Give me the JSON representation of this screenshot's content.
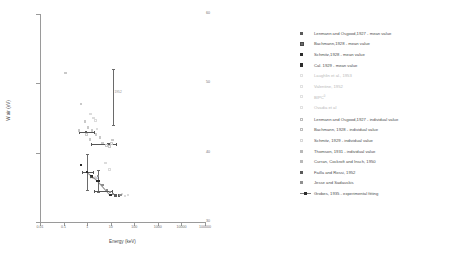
{
  "chart_data": {
    "type": "scatter",
    "title": "",
    "xlabel": "Energy (keV)",
    "ylabel": "W air (eV)",
    "xscale": "log",
    "yscale": "linear",
    "xlim": [
      0.01,
      100000
    ],
    "ylim": [
      30,
      60
    ],
    "xticks": [
      "0.01",
      "0.1",
      "1",
      "10",
      "100",
      "1000",
      "10000",
      "100000"
    ],
    "yticks": [
      "60",
      "50",
      "40",
      "30"
    ],
    "grid": false,
    "legend_position": "right",
    "series": [
      {
        "name": "Lenmann and Osgood,1927 - mean value",
        "marker": "filled-square",
        "points": [
          [
            0.9,
            43.0
          ]
        ]
      },
      {
        "name": "Bachmann,1928 - mean value",
        "marker": "large-filled-square",
        "points": [
          [
            8.0,
            41.2
          ]
        ]
      },
      {
        "name": "Schmitz,1928 - mean value",
        "marker": "filled-square-dark",
        "points": [
          [
            2.8,
            35.9
          ],
          [
            10.0,
            33.9
          ]
        ]
      },
      {
        "name": "Cal. 1929 - mean value",
        "marker": "filled-square-dark",
        "points": [
          [
            0.55,
            38.2
          ],
          [
            1.0,
            37.2
          ],
          [
            1.5,
            36.6
          ]
        ]
      },
      {
        "name": "Laughlin et al., 1953",
        "marker": "open-square-faint",
        "points": [
          [
            6.0,
            38.5
          ],
          [
            9.0,
            37.6
          ]
        ]
      },
      {
        "name": "Valentine, 1952",
        "marker": "dot-faint",
        "points": [
          [
            30.0,
            34.0
          ]
        ]
      },
      {
        "name": "BIPC",
        "marker": "tick-faint",
        "points": [
          [
            40.0,
            33.8
          ]
        ]
      },
      {
        "name": "Ovadia et al",
        "marker": "cross-faint",
        "points": [
          [
            55.0,
            33.9
          ]
        ]
      },
      {
        "name": "Lenmann and Osgood,1927 - individual value",
        "marker": "open-square",
        "points": [
          [
            0.12,
            51.5
          ],
          [
            0.55,
            47.0
          ],
          [
            0.8,
            44.5
          ],
          [
            1.1,
            43.6
          ],
          [
            1.6,
            43.2
          ],
          [
            0.95,
            42.6
          ],
          [
            1.3,
            41.9
          ],
          [
            0.45,
            43.2
          ],
          [
            2.4,
            42.6
          ],
          [
            3.5,
            42.2
          ]
        ]
      },
      {
        "name": "Bachmann, 1928 - individual value",
        "marker": "open-square",
        "points": [
          [
            4.5,
            41.4
          ],
          [
            6.5,
            41.0
          ],
          [
            9.0,
            40.9
          ],
          [
            11.0,
            41.3
          ],
          [
            12.0,
            41.8
          ]
        ]
      },
      {
        "name": "Schmitz, 1929 - individual value",
        "marker": "grey-square",
        "points": [
          [
            2.2,
            44.6
          ],
          [
            1.9,
            45.0
          ],
          [
            1.4,
            45.6
          ],
          [
            2.6,
            43.4
          ]
        ]
      },
      {
        "name": "Thomson, 1931 - individual value",
        "marker": "mid-square",
        "points": [
          [
            3.0,
            36.6
          ],
          [
            4.5,
            35.3
          ],
          [
            7.0,
            34.6
          ]
        ]
      },
      {
        "name": "Curran, Cockroft and Insch, 1950",
        "marker": "mid-square",
        "points": [
          [
            9.5,
            34.3
          ],
          [
            13.0,
            34.0
          ]
        ]
      },
      {
        "name": "Failla and Rossi, 1952",
        "marker": "filled-square",
        "points": [
          [
            16.0,
            33.8
          ],
          [
            22.0,
            33.8
          ]
        ]
      },
      {
        "name": "Jesse and Sadauskis",
        "marker": "cross",
        "points": [
          [
            26.0,
            33.9
          ]
        ]
      },
      {
        "name": "Grobes, 1935 - experimental fitting",
        "marker": "line-with-square",
        "points": [
          [
            1.0,
            37.2
          ],
          [
            3.0,
            35.9
          ],
          [
            10.0,
            33.9
          ]
        ]
      }
    ],
    "error_bars": [
      {
        "x": 0.9,
        "y": 43.0,
        "xerr_lo": 0.45,
        "xerr_hi": 1.9
      },
      {
        "x": 8.0,
        "y": 41.2,
        "xerr_lo": 1.5,
        "xerr_hi": 16.0
      },
      {
        "x": 2.8,
        "y": 35.9,
        "yerr": 1.6
      },
      {
        "x": 1.0,
        "y": 37.2,
        "yerr": 2.6,
        "xerr_lo": 0.6,
        "xerr_hi": 1.7
      },
      {
        "x": 5.0,
        "y": 34.4,
        "xerr_lo": 2.0,
        "xerr_hi": 11.0
      },
      {
        "x": 13.0,
        "y": 48.0,
        "yerr": 4.0
      }
    ],
    "annotations": [
      {
        "text": "Failla",
        "x": 1.1,
        "y": 36.0
      },
      {
        "text": "1952",
        "x": 12.0,
        "y": 48.5
      }
    ]
  },
  "axes": {
    "x_title": "Energy (keV)",
    "y_title": "W air (eV)",
    "x_tick_labels": [
      "0.01",
      "0.1",
      "1",
      "10",
      "100",
      "1000",
      "10000",
      "100000"
    ],
    "y_tick_labels": [
      "60",
      "50",
      "40",
      "30"
    ]
  },
  "legend_mean": {
    "items": [
      {
        "label": "Lenmann and Osgood,1927 - mean value",
        "marker": "filled-square"
      },
      {
        "label": "Bachmann,1928 - mean value",
        "marker": "large-filled-square"
      },
      {
        "label": "Schmitz,1928 - mean value",
        "marker": "filled-square-dark"
      },
      {
        "label": "Cal. 1929 - mean value",
        "marker": "filled-square-dark"
      },
      {
        "label": "Laughlin et al., 1953",
        "marker": "open-square-faint"
      },
      {
        "label": "Valentine, 1952",
        "marker": "dot-faint"
      },
      {
        "label": "BIPC",
        "marker": "tick-faint",
        "superscript": "0"
      },
      {
        "label": "Ovadia et al",
        "marker": "cross-faint"
      }
    ]
  },
  "legend_individual": {
    "items": [
      {
        "label": "Lenmann and Osgood,1927 - individual value",
        "marker": "open-square"
      },
      {
        "label": "Bachmann, 1928 - individual value",
        "marker": "open-square"
      },
      {
        "label": "Schmitz, 1929 - individual value",
        "marker": "grey-square"
      },
      {
        "label": "Thomson, 1931 - individual value",
        "marker": "mid-square"
      },
      {
        "label": "Curran, Cockroft and Insch, 1950",
        "marker": "mid-square"
      },
      {
        "label": "Failla and Rossi, 1952",
        "marker": "filled-square"
      },
      {
        "label": "Jesse and Sadauskis",
        "marker": "cross"
      },
      {
        "label": "Grobes, 1935 - experimental fitting",
        "marker": "line-with-square"
      }
    ]
  }
}
